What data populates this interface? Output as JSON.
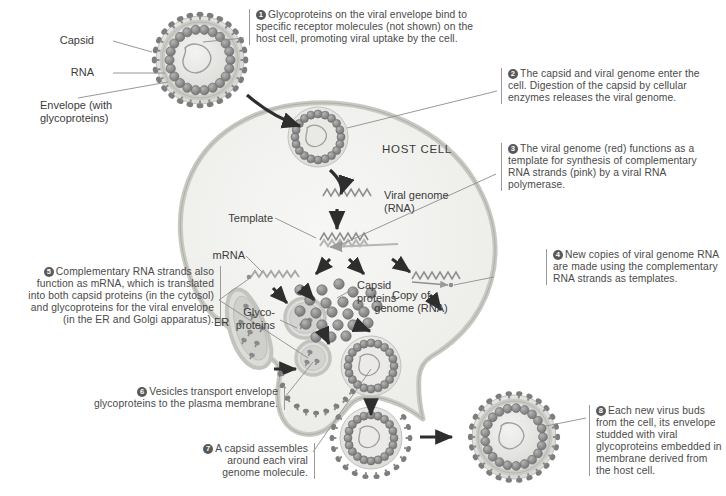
{
  "figure": {
    "host_cell_label": "HOST CELL"
  },
  "colors": {
    "cell_fill": "#f2f2f0",
    "cell_membrane": "#cfcfca",
    "capsid_bead": "#8a8a8a",
    "envelope_bead": "#787878",
    "text": "#4a4a4a",
    "rule": "#9a9a9a",
    "arrow": "#2e2e2e",
    "leader": "#8d8d8d",
    "genome_red": "#b0b0b0",
    "genome_pink": "#bdbdbd",
    "protein_dot": "#8d8d8d",
    "er_fill": "#d9d9d6"
  },
  "virus_labels": [
    {
      "name": "capsid",
      "text": "Capsid"
    },
    {
      "name": "rna",
      "text": "RNA"
    },
    {
      "name": "envelope",
      "text": "Envelope (with\nglycoproteins)"
    }
  ],
  "cell_labels": [
    {
      "name": "viral-genome",
      "text": "Viral genome\n(RNA)"
    },
    {
      "name": "template",
      "text": "Template"
    },
    {
      "name": "mrna",
      "text": "mRNA"
    },
    {
      "name": "capsid-proteins",
      "text": "Capsid\nproteins"
    },
    {
      "name": "glycoproteins",
      "text": "Glyco-\nproteins"
    },
    {
      "name": "er",
      "text": "ER"
    },
    {
      "name": "copy-of-genome",
      "text": "Copy of\ngenome (RNA)"
    }
  ],
  "steps": [
    {
      "number": "1",
      "text": "Glycoproteins on the viral envelope bind to specific receptor molecules (not shown) on the host cell, promoting viral uptake by the cell."
    },
    {
      "number": "2",
      "text": "The capsid and viral genome enter the cell. Digestion of the capsid by cellular enzymes releases the viral genome."
    },
    {
      "number": "3",
      "text": "The viral genome (red) functions as a template for synthesis of complementary RNA strands (pink) by a viral RNA polymerase."
    },
    {
      "number": "4",
      "text": "New copies of viral genome RNA are made using the complementary RNA strands as templates."
    },
    {
      "number": "5",
      "text": "Complementary RNA strands also function as mRNA, which is translated into both capsid proteins (in the cytosol) and glycoproteins for the viral envelope (in the ER and Golgi apparatus)."
    },
    {
      "number": "6",
      "text": "Vesicles transport envelope glycoproteins to the plasma membrane."
    },
    {
      "number": "7",
      "text": "A capsid assembles around each viral genome molecule."
    },
    {
      "number": "8",
      "text": "Each new virus buds from the cell, its envelope studded with viral glycoproteins embedded in membrane derived from the host cell."
    }
  ]
}
